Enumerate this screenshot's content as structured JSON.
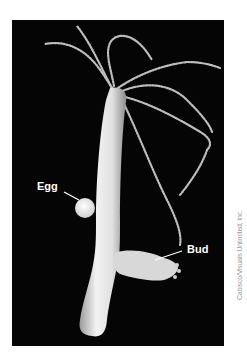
{
  "figure": {
    "background_color": "#050505",
    "body_color": "#e6e6e6",
    "labels": [
      {
        "text": "Egg"
      },
      {
        "text": "Bud"
      }
    ],
    "credit": "Cabisco/Visuals Unlimited, Inc."
  }
}
